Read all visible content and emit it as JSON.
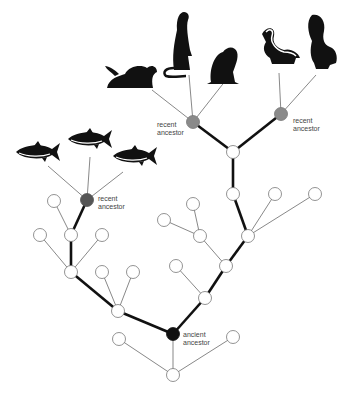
{
  "diagram": {
    "type": "phylogenetic-tree",
    "colors": {
      "background": "#ffffff",
      "thin_line": "#555555",
      "thick_line": "#111111",
      "node_white_fill": "#ffffff",
      "node_stroke": "#777777",
      "recent_ancestor_mammal": "#8a8a8a",
      "recent_ancestor_fish": "#555555",
      "ancient_ancestor": "#111111",
      "silhouette": "#111111"
    },
    "labels": [
      {
        "id": "fish-recent",
        "line1": "recent",
        "line2": "ancestor",
        "x": 98,
        "y": 195
      },
      {
        "id": "mammal-left-recent",
        "line1": "recent",
        "line2": "ancestor",
        "x": 157,
        "y": 121
      },
      {
        "id": "mammal-right-recent",
        "line1": "recent",
        "line2": "ancestor",
        "x": 293,
        "y": 117
      },
      {
        "id": "ancient",
        "line1": "ancient",
        "line2": "ancestor",
        "x": 183,
        "y": 331
      }
    ],
    "organisms": [
      {
        "name": "tuna-1",
        "icon": "fish",
        "x": 38,
        "y": 152
      },
      {
        "name": "tuna-2",
        "icon": "fish",
        "x": 90,
        "y": 139
      },
      {
        "name": "tuna-3",
        "icon": "fish",
        "x": 135,
        "y": 156
      },
      {
        "name": "sea-otter",
        "icon": "otter",
        "x": 133,
        "y": 70
      },
      {
        "name": "weasel",
        "icon": "weasel",
        "x": 180,
        "y": 40
      },
      {
        "name": "marmot",
        "icon": "marmot",
        "x": 225,
        "y": 62
      },
      {
        "name": "striped-skunk",
        "icon": "skunk",
        "x": 280,
        "y": 48
      },
      {
        "name": "spotted-skunk",
        "icon": "spotted-skunk",
        "x": 322,
        "y": 45
      }
    ],
    "nodes": [
      {
        "id": "n_bottom",
        "x": 173,
        "y": 375,
        "kind": "white"
      },
      {
        "id": "n_bl",
        "x": 119,
        "y": 339,
        "kind": "white"
      },
      {
        "id": "n_br",
        "x": 233,
        "y": 337,
        "kind": "white"
      },
      {
        "id": "n_ancient",
        "x": 173,
        "y": 334,
        "kind": "ancient"
      },
      {
        "id": "n_l1",
        "x": 118,
        "y": 311,
        "kind": "white"
      },
      {
        "id": "n_l1a",
        "x": 102,
        "y": 272,
        "kind": "white"
      },
      {
        "id": "n_l1b",
        "x": 133,
        "y": 272,
        "kind": "white"
      },
      {
        "id": "n_l2",
        "x": 71,
        "y": 272,
        "kind": "white"
      },
      {
        "id": "n_l2a",
        "x": 40,
        "y": 235,
        "kind": "white"
      },
      {
        "id": "n_l2b",
        "x": 102,
        "y": 235,
        "kind": "white"
      },
      {
        "id": "n_l3",
        "x": 71,
        "y": 235,
        "kind": "white"
      },
      {
        "id": "n_l3a",
        "x": 54,
        "y": 201,
        "kind": "white"
      },
      {
        "id": "n_fish",
        "x": 87,
        "y": 200,
        "kind": "recent-fish"
      },
      {
        "id": "n_r1",
        "x": 205,
        "y": 298,
        "kind": "white"
      },
      {
        "id": "n_r1a",
        "x": 176,
        "y": 266,
        "kind": "white"
      },
      {
        "id": "n_r2",
        "x": 226,
        "y": 266,
        "kind": "white"
      },
      {
        "id": "n_r2a",
        "x": 200,
        "y": 236,
        "kind": "white"
      },
      {
        "id": "n_r2a1",
        "x": 164,
        "y": 220,
        "kind": "white"
      },
      {
        "id": "n_r2a2",
        "x": 193,
        "y": 204,
        "kind": "white"
      },
      {
        "id": "n_r3",
        "x": 248,
        "y": 236,
        "kind": "white"
      },
      {
        "id": "n_r3a",
        "x": 275,
        "y": 194,
        "kind": "white"
      },
      {
        "id": "n_r3b",
        "x": 315,
        "y": 194,
        "kind": "white"
      },
      {
        "id": "n_r4",
        "x": 233,
        "y": 194,
        "kind": "white"
      },
      {
        "id": "n_r5",
        "x": 233,
        "y": 152,
        "kind": "white"
      },
      {
        "id": "n_ml",
        "x": 193,
        "y": 122,
        "kind": "recent-mammal"
      },
      {
        "id": "n_mr",
        "x": 281,
        "y": 114,
        "kind": "recent-mammal"
      }
    ],
    "edges": [
      {
        "from": "n_ancient",
        "to": "n_bottom",
        "thick": false
      },
      {
        "from": "n_bottom",
        "to": "n_bl",
        "thick": false
      },
      {
        "from": "n_bottom",
        "to": "n_br",
        "thick": false
      },
      {
        "from": "n_ancient",
        "to": "n_l1",
        "thick": true
      },
      {
        "from": "n_l1",
        "to": "n_l1a",
        "thick": false
      },
      {
        "from": "n_l1",
        "to": "n_l1b",
        "thick": false
      },
      {
        "from": "n_l1",
        "to": "n_l2",
        "thick": true
      },
      {
        "from": "n_l2",
        "to": "n_l2a",
        "thick": false
      },
      {
        "from": "n_l2",
        "to": "n_l2b",
        "thick": false
      },
      {
        "from": "n_l2",
        "to": "n_l3",
        "thick": true
      },
      {
        "from": "n_l3",
        "to": "n_l3a",
        "thick": false
      },
      {
        "from": "n_l3",
        "to": "n_fish",
        "thick": true
      },
      {
        "from": "n_ancient",
        "to": "n_r1",
        "thick": true
      },
      {
        "from": "n_r1",
        "to": "n_r1a",
        "thick": false
      },
      {
        "from": "n_r1",
        "to": "n_r2",
        "thick": true
      },
      {
        "from": "n_r2",
        "to": "n_r2a",
        "thick": false
      },
      {
        "from": "n_r2a",
        "to": "n_r2a1",
        "thick": false
      },
      {
        "from": "n_r2a",
        "to": "n_r2a2",
        "thick": false
      },
      {
        "from": "n_r2",
        "to": "n_r3",
        "thick": true
      },
      {
        "from": "n_r3",
        "to": "n_r3a",
        "thick": false
      },
      {
        "from": "n_r3",
        "to": "n_r3b",
        "thick": false
      },
      {
        "from": "n_r3",
        "to": "n_r4",
        "thick": true
      },
      {
        "from": "n_r4",
        "to": "n_r5",
        "thick": true
      },
      {
        "from": "n_r5",
        "to": "n_ml",
        "thick": true
      },
      {
        "from": "n_r5",
        "to": "n_mr",
        "thick": true
      }
    ],
    "leaf_edges": [
      {
        "x1": 87,
        "y1": 200,
        "x2": 48,
        "y2": 166
      },
      {
        "x1": 87,
        "y1": 200,
        "x2": 90,
        "y2": 157
      },
      {
        "x1": 87,
        "y1": 200,
        "x2": 123,
        "y2": 172
      },
      {
        "x1": 193,
        "y1": 122,
        "x2": 152,
        "y2": 90
      },
      {
        "x1": 193,
        "y1": 122,
        "x2": 189,
        "y2": 75
      },
      {
        "x1": 193,
        "y1": 122,
        "x2": 226,
        "y2": 80
      },
      {
        "x1": 281,
        "y1": 114,
        "x2": 279,
        "y2": 73
      },
      {
        "x1": 281,
        "y1": 114,
        "x2": 316,
        "y2": 75
      }
    ]
  }
}
